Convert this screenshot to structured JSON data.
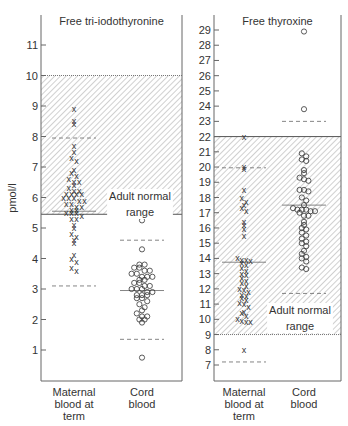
{
  "chart_data": [
    {
      "type": "scatter",
      "title": "Free tri-iodothyronine",
      "ylabel": "pmol/l",
      "ylim": [
        0,
        12
      ],
      "yticks": [
        1,
        2,
        3,
        4,
        5,
        6,
        7,
        8,
        9,
        10,
        11
      ],
      "categories": [
        "Maternal blood at term",
        "Cord blood"
      ],
      "category_lines": [
        [
          "Maternal",
          "blood at",
          "term"
        ],
        [
          "Cord",
          "blood"
        ]
      ],
      "normal_range": {
        "label_lines": [
          "Adult normal",
          "range"
        ],
        "low": 5.45,
        "high": 10.0
      },
      "series": [
        {
          "name": "Maternal blood at term",
          "marker": "x",
          "values": [
            8.9,
            8.5,
            8.4,
            7.7,
            7.5,
            7.3,
            7.2,
            6.9,
            6.8,
            6.7,
            6.6,
            6.5,
            6.5,
            6.4,
            6.3,
            6.2,
            6.2,
            6.1,
            6.1,
            6.1,
            6.1,
            6.0,
            6.0,
            6.0,
            5.9,
            5.9,
            5.8,
            5.8,
            5.7,
            5.7,
            5.6,
            5.6,
            5.5,
            5.5,
            5.5,
            5.4,
            5.3,
            5.3,
            5.1,
            5.0,
            4.8,
            4.7,
            4.6,
            4.5,
            4.1,
            4.0,
            3.9,
            3.7,
            3.6
          ],
          "reference_lines": [
            7.95,
            5.55,
            3.1
          ]
        },
        {
          "name": "Cord blood",
          "marker": "o",
          "values": [
            5.25,
            4.3,
            3.8,
            3.8,
            3.7,
            3.7,
            3.6,
            3.6,
            3.5,
            3.5,
            3.4,
            3.4,
            3.4,
            3.3,
            3.3,
            3.2,
            3.2,
            3.1,
            3.1,
            3.0,
            3.0,
            3.0,
            2.9,
            2.9,
            2.8,
            2.8,
            2.8,
            2.7,
            2.7,
            2.6,
            2.5,
            2.4,
            2.3,
            2.2,
            2.1,
            2.1,
            2.0,
            2.0,
            1.9,
            0.75
          ],
          "reference_lines": [
            4.6,
            2.95,
            1.35
          ]
        }
      ]
    },
    {
      "type": "scatter",
      "title": "Free thyroxine",
      "ylabel": "pmol/l",
      "ylim": [
        6,
        30
      ],
      "yticks": [
        7,
        8,
        9,
        10,
        11,
        12,
        13,
        14,
        15,
        16,
        17,
        18,
        19,
        20,
        21,
        22,
        23,
        24,
        25,
        26,
        27,
        28,
        29
      ],
      "categories": [
        "Maternal blood at term",
        "Cord blood"
      ],
      "category_lines": [
        [
          "Maternal",
          "blood at",
          "term"
        ],
        [
          "Cord",
          "blood"
        ]
      ],
      "normal_range": {
        "label_lines": [
          "Adult normal",
          "range"
        ],
        "low": 9.0,
        "high": 22.0
      },
      "series": [
        {
          "name": "Maternal blood at term",
          "marker": "x",
          "values": [
            22.0,
            20.0,
            19.9,
            18.5,
            18.0,
            17.7,
            17.5,
            17.3,
            17.1,
            16.4,
            16.2,
            15.9,
            15.5,
            14.0,
            13.9,
            13.9,
            13.8,
            13.7,
            13.6,
            13.4,
            13.2,
            13.0,
            12.9,
            12.7,
            12.5,
            12.4,
            12.2,
            12.0,
            11.9,
            11.8,
            11.6,
            11.5,
            11.4,
            11.3,
            11.1,
            11.0,
            10.8,
            10.5,
            10.4,
            10.2,
            10.0,
            9.9,
            9.8,
            9.8,
            8.0
          ],
          "reference_lines": [
            19.95,
            13.75,
            7.2
          ]
        },
        {
          "name": "Cord blood",
          "marker": "o",
          "values": [
            28.9,
            23.8,
            20.9,
            20.7,
            20.5,
            20.4,
            19.8,
            19.6,
            19.3,
            19.2,
            19.1,
            18.5,
            18.5,
            18.4,
            18.0,
            17.8,
            17.5,
            17.3,
            17.2,
            17.2,
            17.2,
            17.1,
            17.1,
            17.0,
            16.8,
            16.8,
            16.4,
            16.2,
            16.0,
            15.9,
            15.7,
            15.5,
            15.3,
            15.1,
            15.0,
            14.8,
            14.5,
            14.3,
            14.1,
            14.0,
            13.8,
            13.4,
            13.3
          ],
          "reference_lines": [
            23.0,
            17.5,
            11.7
          ]
        }
      ]
    }
  ]
}
